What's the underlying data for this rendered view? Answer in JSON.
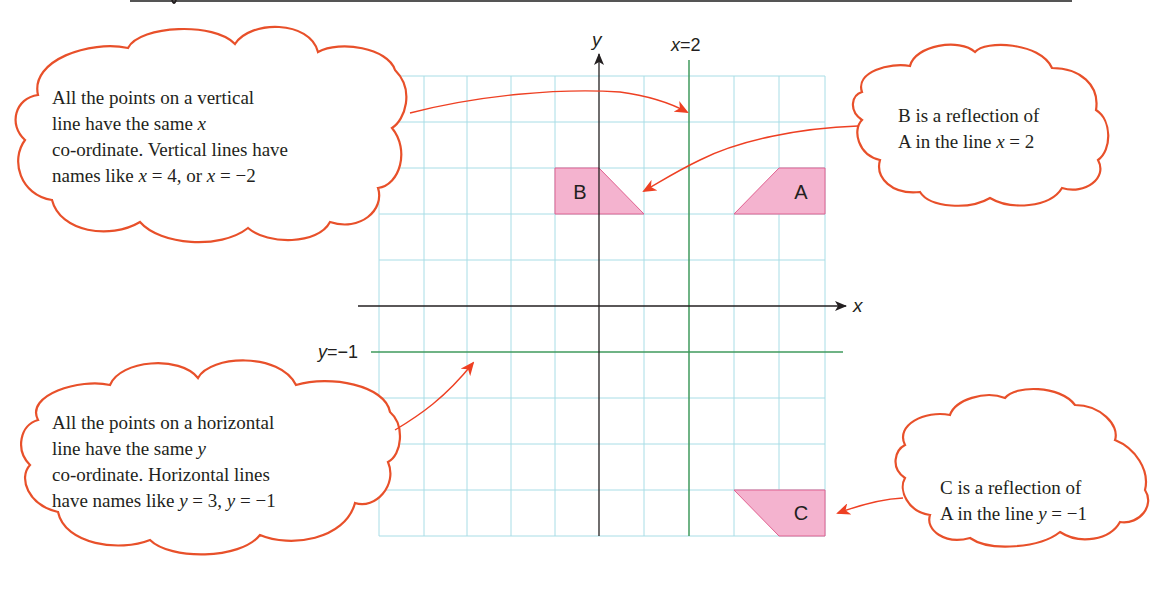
{
  "header": {
    "rule_color": "#444444"
  },
  "colors": {
    "grid": "#a8dde6",
    "axis": "#231f20",
    "mirror_line": "#3f9a5c",
    "shape_fill": "#f4b3cf",
    "shape_stroke": "#e0608f",
    "cloud_stroke": "#e8502a",
    "arrow": "#ee4023"
  },
  "axes": {
    "x_label": "x",
    "y_label": "y",
    "x_range": [
      -5,
      5
    ],
    "y_range": [
      -5,
      5
    ]
  },
  "mirror_lines": {
    "vertical": {
      "label_var": "x",
      "label_rest": "=2",
      "value": 2
    },
    "horizontal": {
      "label_var": "y",
      "label_rest": "=−1",
      "value": -1
    }
  },
  "shapes": [
    {
      "name": "A",
      "label": "A",
      "points": [
        [
          3,
          2
        ],
        [
          5,
          2
        ],
        [
          5,
          3
        ],
        [
          4,
          3
        ]
      ]
    },
    {
      "name": "B",
      "label": "B",
      "points": [
        [
          -1,
          2
        ],
        [
          1,
          2
        ],
        [
          0,
          3
        ],
        [
          -1,
          3
        ]
      ]
    },
    {
      "name": "C",
      "label": "C",
      "points": [
        [
          3,
          -4
        ],
        [
          5,
          -4
        ],
        [
          5,
          -5
        ],
        [
          4,
          -5
        ]
      ]
    }
  ],
  "clouds": {
    "vertical_info": {
      "lines": [
        "All the points on a vertical",
        "line have the same ",
        "co-ordinate. Vertical lines have",
        "names like "
      ],
      "line2_var": "x",
      "line4_parts": [
        "x",
        " = 4, or ",
        "x",
        " = −2"
      ]
    },
    "reflection_b": {
      "line1": "B is a reflection of",
      "line2_prefix": "A in the line ",
      "line2_var": "x",
      "line2_suffix": " = 2"
    },
    "horizontal_info": {
      "lines": [
        "All the points on a horizontal",
        "line have the same ",
        "co-ordinate. Horizontal lines",
        "have names like "
      ],
      "line2_var": "y",
      "line4_parts": [
        "y",
        " = 3, ",
        "y",
        " = −1"
      ]
    },
    "reflection_c": {
      "line1": "C is a reflection of",
      "line2_prefix": "A in the line ",
      "line2_var": "y",
      "line2_suffix": " = −1"
    }
  }
}
